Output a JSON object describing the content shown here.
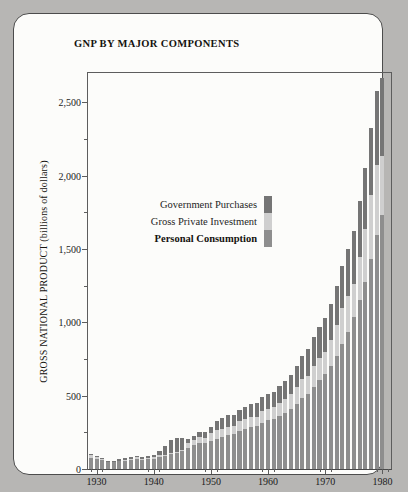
{
  "title": "GNP BY MAJOR COMPONENTS",
  "legend": [
    {
      "label": "Government Purchases",
      "key": "government_purchases",
      "color": "#757575",
      "bold": false
    },
    {
      "label": "Gross Private Investment",
      "key": "gross_private_investment",
      "color": "#cfcfcf",
      "bold": false
    },
    {
      "label": "Personal Consumption",
      "key": "personal_consumption",
      "color": "#8e8e8e",
      "bold": true
    }
  ],
  "chart_data": {
    "type": "bar",
    "subtype": "stacked-vertical",
    "title": "GNP BY MAJOR COMPONENTS",
    "xlabel": "",
    "ylabel": "GROSS NATIONAL PRODUCT (billions of dollars)",
    "ylim": [
      0,
      2700
    ],
    "xlim": [
      1928.5,
      1981.5
    ],
    "grid": false,
    "legend_position": "inside-upper-left",
    "ytick_labels": [
      "0",
      "500",
      "1,000",
      "1,500",
      "2,000",
      "2,500"
    ],
    "ytick_values": [
      0,
      500,
      1000,
      1500,
      2000,
      2500
    ],
    "ytick_minor_values": [
      250,
      750,
      1250,
      1750,
      2250
    ],
    "xtick_labels": [
      "1930",
      "1940",
      "1950",
      "1960",
      "1970",
      "1980"
    ],
    "xtick_values": [
      1930,
      1940,
      1950,
      1960,
      1970,
      1980
    ],
    "xtick_minor_values": [
      1929,
      1931,
      1939,
      1941,
      1949,
      1951,
      1959,
      1961,
      1969,
      1971,
      1979,
      1981
    ],
    "categories": [
      1929,
      1930,
      1931,
      1932,
      1933,
      1934,
      1935,
      1936,
      1937,
      1938,
      1939,
      1940,
      1941,
      1942,
      1943,
      1944,
      1945,
      1946,
      1947,
      1948,
      1949,
      1950,
      1951,
      1952,
      1953,
      1954,
      1955,
      1956,
      1957,
      1958,
      1959,
      1960,
      1961,
      1962,
      1963,
      1964,
      1965,
      1966,
      1967,
      1968,
      1969,
      1970,
      1971,
      1972,
      1973,
      1974,
      1975,
      1976,
      1977,
      1978,
      1979,
      1980
    ],
    "series": [
      {
        "name": "Personal Consumption",
        "color": "#8e8e8e",
        "values": [
          77,
          70,
          61,
          49,
          46,
          52,
          56,
          62,
          67,
          64,
          67,
          71,
          81,
          89,
          100,
          109,
          120,
          144,
          165,
          175,
          178,
          192,
          208,
          219,
          233,
          240,
          259,
          271,
          285,
          294,
          317,
          332,
          343,
          364,
          384,
          412,
          444,
          481,
          509,
          559,
          604,
          648,
          702,
          771,
          852,
          933,
          1034,
          1152,
          1278,
          1430,
          1596,
          1732
        ]
      },
      {
        "name": "Gross Private Investment",
        "color": "#cfcfcf",
        "values": [
          16,
          10,
          5,
          1,
          1,
          3,
          6,
          8,
          12,
          7,
          9,
          13,
          18,
          10,
          6,
          7,
          11,
          31,
          34,
          46,
          36,
          54,
          59,
          52,
          53,
          52,
          68,
          70,
          68,
          61,
          78,
          78,
          77,
          87,
          94,
          102,
          118,
          131,
          128,
          141,
          155,
          150,
          178,
          208,
          245,
          249,
          230,
          292,
          361,
          436,
          475,
          402
        ]
      },
      {
        "name": "Government Purchases",
        "color": "#757575",
        "values": [
          9,
          10,
          9,
          8,
          8,
          10,
          10,
          12,
          12,
          13,
          13,
          14,
          25,
          60,
          89,
          96,
          83,
          28,
          26,
          32,
          38,
          38,
          60,
          75,
          82,
          76,
          75,
          79,
          87,
          95,
          98,
          100,
          108,
          118,
          124,
          130,
          138,
          159,
          181,
          200,
          211,
          234,
          247,
          269,
          288,
          318,
          358,
          384,
          416,
          458,
          507,
          534
        ]
      }
    ],
    "totals": [
      102,
      90,
      75,
      58,
      55,
      65,
      72,
      82,
      91,
      84,
      89,
      98,
      124,
      159,
      195,
      212,
      214,
      203,
      225,
      253,
      252,
      284,
      327,
      346,
      368,
      368,
      402,
      420,
      440,
      450,
      493,
      510,
      528,
      569,
      602,
      644,
      700,
      771,
      818,
      900,
      970,
      1032,
      1127,
      1248,
      1385,
      1500,
      1622,
      1828,
      2055,
      2324,
      2578,
      2668
    ]
  }
}
